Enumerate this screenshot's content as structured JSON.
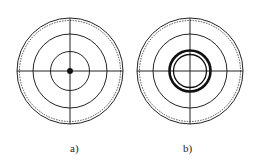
{
  "figure": {
    "panels": [
      {
        "id": "a",
        "label": "a)",
        "description": "Concentric circle target with crosshair and solid center dot",
        "center_marker": "dot"
      },
      {
        "id": "b",
        "label": "b)",
        "description": "Concentric circle target with crosshair and thick double ring at center",
        "center_marker": "double-ring"
      }
    ]
  },
  "colors": {
    "stroke": "#222222",
    "background": "#ffffff"
  }
}
